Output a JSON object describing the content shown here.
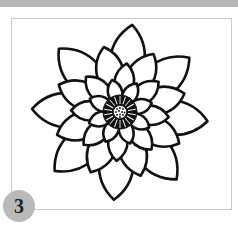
{
  "page": {
    "topbar_color": "#b7b7b7",
    "frame_border_color": "#c9c9c9"
  },
  "illustration": {
    "subject": "flower-coloring-page",
    "description": "Line-art layered flower (dahlia/lotus style) with spiky center and dotted core",
    "stroke_color": "#111111",
    "fill_color": "#ffffff"
  },
  "badge": {
    "number": "3",
    "color": "#b9b9b9"
  }
}
